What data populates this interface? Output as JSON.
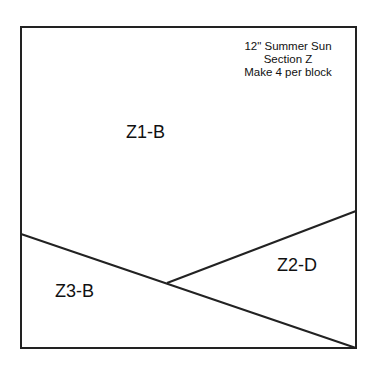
{
  "diagram": {
    "title_lines": [
      "12\" Summer Sun",
      "Section Z",
      "Make 4 per block"
    ],
    "stroke_color": "#222222",
    "background": "#ffffff",
    "frame": {
      "x1": 21,
      "y1": 27,
      "x2": 356,
      "y2": 348
    },
    "lines": [
      {
        "name": "diagonal-main",
        "x1": 21,
        "y1": 234,
        "x2": 356,
        "y2": 348
      },
      {
        "name": "diagonal-upper",
        "x1": 167,
        "y1": 283,
        "x2": 356,
        "y2": 211
      }
    ],
    "zones": [
      {
        "id": "Z1-B",
        "label": "Z1-B"
      },
      {
        "id": "Z2-D",
        "label": "Z2-D"
      },
      {
        "id": "Z3-B",
        "label": "Z3-B"
      }
    ]
  }
}
